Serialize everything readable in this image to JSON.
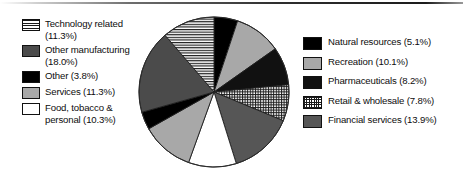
{
  "chart_data": {
    "type": "pie",
    "title": "",
    "legend_position": "left-and-right",
    "start_angle_deg": 0,
    "direction": "clockwise",
    "unit": "%",
    "categories": [
      "Natural resources",
      "Recreation",
      "Pharmaceuticals",
      "Retail & wholesale",
      "Financial services",
      "Food, tobacco & personal",
      "Services",
      "Other",
      "Other manufacturing",
      "Technology related"
    ],
    "values": [
      5.1,
      10.1,
      8.2,
      7.8,
      13.9,
      10.3,
      11.3,
      3.8,
      18.0,
      11.3
    ],
    "slices": [
      {
        "label": "Natural resources",
        "value": 5.1,
        "pattern": "solid-black",
        "color": "#000000"
      },
      {
        "label": "Recreation",
        "value": 10.1,
        "pattern": "solid-light-gray",
        "color": "#a8a8a8"
      },
      {
        "label": "Pharmaceuticals",
        "value": 8.2,
        "pattern": "solid-near-black",
        "color": "#111111"
      },
      {
        "label": "Retail & wholesale",
        "value": 7.8,
        "pattern": "crosshatch-grid",
        "color": "#1c1c1c"
      },
      {
        "label": "Financial services",
        "value": 13.9,
        "pattern": "solid-mid-dark-gray",
        "color": "#565656"
      },
      {
        "label": "Food, tobacco & personal",
        "value": 10.3,
        "pattern": "solid-white",
        "color": "#ffffff"
      },
      {
        "label": "Services",
        "value": 11.3,
        "pattern": "solid-light-gray",
        "color": "#a8a8a8"
      },
      {
        "label": "Other",
        "value": 3.8,
        "pattern": "solid-black",
        "color": "#000000"
      },
      {
        "label": "Other manufacturing",
        "value": 18.0,
        "pattern": "solid-dark-gray",
        "color": "#4b4b4b"
      },
      {
        "label": "Technology related",
        "value": 11.3,
        "pattern": "horizontal-stripes",
        "color": "#1a1a1a"
      }
    ]
  },
  "legend_left": {
    "items": [
      {
        "label": "Technology related\n(11.3%)",
        "swatch": "horizontal-stripes"
      },
      {
        "label": "Other manufacturing\n(18.0%)",
        "swatch": "solid-dark-gray"
      },
      {
        "label": "Other (3.8%)",
        "swatch": "solid-black"
      },
      {
        "label": "Services (11.3%)",
        "swatch": "solid-light-gray"
      },
      {
        "label": "Food, tobacco &\npersonal (10.3%)",
        "swatch": "solid-white"
      }
    ]
  },
  "legend_right": {
    "items": [
      {
        "label": "Natural resources (5.1%)",
        "swatch": "solid-black"
      },
      {
        "label": "Recreation (10.1%)",
        "swatch": "solid-light-gray"
      },
      {
        "label": "Pharmaceuticals (8.2%)",
        "swatch": "solid-near-black"
      },
      {
        "label": "Retail & wholesale (7.8%)",
        "swatch": "crosshatch-grid"
      },
      {
        "label": "Financial services (13.9%)",
        "swatch": "solid-mid-dark-gray"
      }
    ]
  }
}
